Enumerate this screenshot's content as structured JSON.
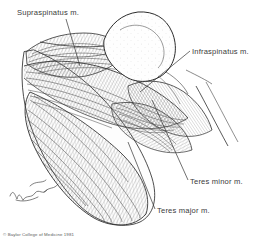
{
  "figure": {
    "kind": "anatomical-line-drawing",
    "width": 271,
    "height": 247,
    "background_color": "#ffffff",
    "ink_color": "#2b2b2b",
    "label_color": "#3a3a3a",
    "shading_color": "#8a8a8a"
  },
  "labels": {
    "supraspinatus": "Supraspinatus m.",
    "infraspinatus": "Infraspinatus m.",
    "teres_minor": "Teres minor m.",
    "teres_major": "Teres major m."
  },
  "credit": {
    "copyright": "© Baylor College of Medicine 1981",
    "signature": "artist signature"
  }
}
